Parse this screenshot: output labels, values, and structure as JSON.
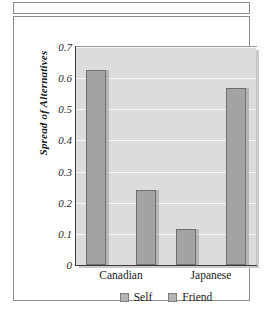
{
  "chart_data": {
    "type": "bar",
    "title": "",
    "xlabel": "",
    "ylabel": "Spread of Alternatives",
    "categories": [
      "Canadian",
      "Japanese"
    ],
    "series": [
      {
        "name": "Self",
        "values": [
          0.625,
          0.115
        ]
      },
      {
        "name": "Friend",
        "values": [
          0.24,
          0.57
        ]
      }
    ],
    "ylim": [
      0,
      0.7
    ],
    "ytick_labels": [
      "0.7",
      "0.6",
      "0.5",
      "0.4",
      "0.3",
      "0.2",
      "0.1",
      "0"
    ],
    "ytick_values": [
      0.7,
      0.6,
      0.5,
      0.4,
      0.3,
      0.2,
      0.1,
      0
    ],
    "grid": true,
    "grid_color": "#f6f6f6",
    "legend_position": "bottom-center",
    "plot_background": "#dcdcdc",
    "bar_fill": "#a3a3a3",
    "bar_edge": "#6f6f6f"
  },
  "legend": {
    "items": [
      {
        "label": "Self"
      },
      {
        "label": "Friend"
      }
    ]
  }
}
